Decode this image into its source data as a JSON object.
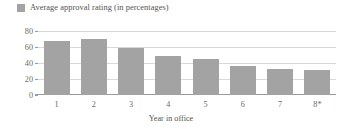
{
  "legend": {
    "position": "top-left",
    "entries": [
      {
        "label": "Average approval rating (in percentages)",
        "color": "#a3a3a3",
        "swatch_icon": "legend-swatch-icon"
      }
    ]
  },
  "axes": {
    "xlabel": "Year in office",
    "ylabel": "",
    "yticks": [
      "80",
      "60",
      "40",
      "20",
      "0"
    ],
    "xticks": [
      "1",
      "2",
      "3",
      "4",
      "5",
      "6",
      "7",
      "8*"
    ]
  },
  "chart_data": {
    "type": "bar",
    "title": "",
    "subtitle": "",
    "categories": [
      "1",
      "2",
      "3",
      "4",
      "5",
      "6",
      "7",
      "8*"
    ],
    "values": [
      67,
      70,
      59,
      49,
      45,
      36,
      32,
      31
    ],
    "series": [
      {
        "name": "Average approval rating (in percentages)",
        "color": "#a3a3a3",
        "values": [
          67,
          70,
          59,
          49,
          45,
          36,
          32,
          31
        ]
      }
    ],
    "xlabel": "Year in office",
    "ylabel": "",
    "ylim": [
      0,
      80
    ],
    "ytick_values": [
      80,
      60,
      40,
      20,
      0
    ],
    "grid": "horizontal",
    "legend_position": "top-left",
    "annotations": [
      "* denotes partial or asterisked year in office"
    ]
  },
  "colors": {
    "bar": "#a3a3a3",
    "gridline": "#d9d9d9",
    "axis": "#9a9a9a",
    "text": "#54524f",
    "background": "#ffffff"
  }
}
